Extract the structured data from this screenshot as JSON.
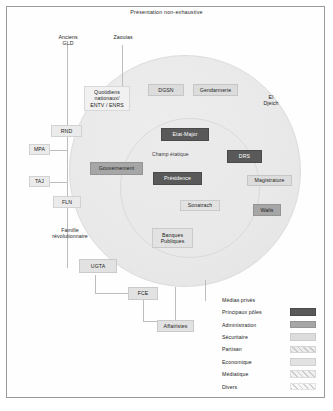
{
  "title": "Présentation non-exhaustive",
  "champ_label": "Champ étatique",
  "nodes": {
    "anciens_gld": "Anciens\nGLD",
    "zaouias": "Zaouias",
    "quotidiens": "Quotidiens\nnationaux/\nENTV / ENRS",
    "dgsn": "DGSN",
    "gendarmerie": "Gendarmerie",
    "el_djeich": "El\nDjeich",
    "rnd": "RND",
    "mpa": "MPA",
    "taj": "TAJ",
    "fln": "FLN",
    "etat_major": "Etat-Major",
    "drs": "DRS",
    "gouvernement": "Gouvernement",
    "presidence": "Présidence",
    "magistrature": "Magistrature",
    "sonatrach": "Sonatrach",
    "walis": "Walis",
    "famille_revolutionnaire": "Famille\nrévolutionnaire",
    "banques_publiques": "Banques\nPubliques",
    "ugta": "UGTA",
    "fce": "FCE",
    "affairistes": "Affairistes",
    "medias_prives": "Médias privés"
  },
  "legend": {
    "items": [
      {
        "label": "Principaux pôles",
        "color": "#595959"
      },
      {
        "label": "Administration",
        "color": "#a6a6a6"
      },
      {
        "label": "Sécuritaire",
        "color": "#dcdcdc"
      },
      {
        "label": "Partisan",
        "color": "#ebebeb"
      },
      {
        "label": "Economique",
        "color": "#e2e2e2"
      },
      {
        "label": "Médiatique",
        "color": "#f1f1f1"
      },
      {
        "label": "Divers",
        "color": "#f8f8f8"
      }
    ]
  }
}
